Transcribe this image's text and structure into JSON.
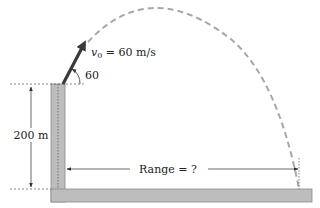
{
  "diagram": {
    "labels": {
      "velocity_symbol": "v",
      "velocity_subscript": "0",
      "velocity_value": " = 60 m/s",
      "angle": "60",
      "height": "200 m",
      "range": "Range = ?"
    },
    "values": {
      "initial_speed_m_per_s": 60,
      "launch_angle_deg": 60,
      "cliff_height_m": 200
    },
    "colors": {
      "structure_fill": "#bdbdbd",
      "structure_stroke": "#8a8a8a",
      "trajectory": "#a8a8a8",
      "arrow": "#3a3a3a",
      "dimension_line": "#444444",
      "text": "#222222"
    }
  }
}
